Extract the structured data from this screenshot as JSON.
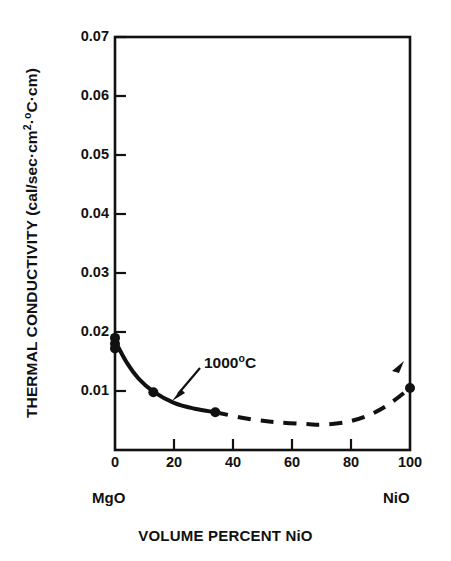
{
  "chart_data": {
    "type": "line",
    "title": "",
    "xlabel": "VOLUME PERCENT NiO",
    "ylabel": "THERMAL CONDUCTIVITY",
    "ylabel_units": "(cal/sec·cm²·°C·cm)",
    "ylabel_prefix": "THERMAL CONDUCTIVITY (cal/sec·cm",
    "ylabel_exp": "2",
    "ylabel_mid": "·",
    "ylabel_deg": "o",
    "ylabel_suffix": "C·cm)",
    "xlim": [
      0,
      100
    ],
    "ylim": [
      0,
      0.07
    ],
    "grid": false,
    "legend": "none",
    "xticks": [
      0,
      20,
      40,
      60,
      80,
      100
    ],
    "xtick_labels": [
      "0",
      "20",
      "40",
      "60",
      "80",
      "100"
    ],
    "yticks": [
      0.01,
      0.02,
      0.03,
      0.04,
      0.05,
      0.06,
      0.07
    ],
    "ytick_labels": [
      "0.01",
      "0.02",
      "0.03",
      "0.04",
      "0.05",
      "0.06",
      "0.07"
    ],
    "endpoint_labels": {
      "left": "MgO",
      "right": "NiO"
    },
    "annotations": [
      {
        "text": "1000°C",
        "text_parts": {
          "value": "1000",
          "degree": "o",
          "unit": "C"
        },
        "x": 24,
        "y": 0.0135
      }
    ],
    "series": [
      {
        "name": "1000°C solid-solution conductivity",
        "style": "solid-then-dashed",
        "solid_segment_x": [
          0,
          34
        ],
        "dashed_segment_x": [
          34,
          100
        ],
        "markers": "filled-circle",
        "color": "#111111",
        "points": [
          {
            "x": 0,
            "y": 0.019
          },
          {
            "x": 0,
            "y": 0.018
          },
          {
            "x": 0,
            "y": 0.0172
          },
          {
            "x": 13,
            "y": 0.0098
          },
          {
            "x": 34,
            "y": 0.0064
          },
          {
            "x": 100,
            "y": 0.0105
          }
        ],
        "curve": [
          {
            "x": 0,
            "y": 0.0185
          },
          {
            "x": 4,
            "y": 0.0148
          },
          {
            "x": 8,
            "y": 0.0121
          },
          {
            "x": 13,
            "y": 0.0099
          },
          {
            "x": 20,
            "y": 0.008
          },
          {
            "x": 27,
            "y": 0.007
          },
          {
            "x": 34,
            "y": 0.0064
          },
          {
            "x": 45,
            "y": 0.0053
          },
          {
            "x": 55,
            "y": 0.0047
          },
          {
            "x": 65,
            "y": 0.0044
          },
          {
            "x": 70,
            "y": 0.0043
          },
          {
            "x": 78,
            "y": 0.0047
          },
          {
            "x": 86,
            "y": 0.0059
          },
          {
            "x": 93,
            "y": 0.0078
          },
          {
            "x": 100,
            "y": 0.0105
          }
        ]
      }
    ]
  },
  "figure": {
    "background": "#ffffff",
    "ink": "#111111"
  }
}
